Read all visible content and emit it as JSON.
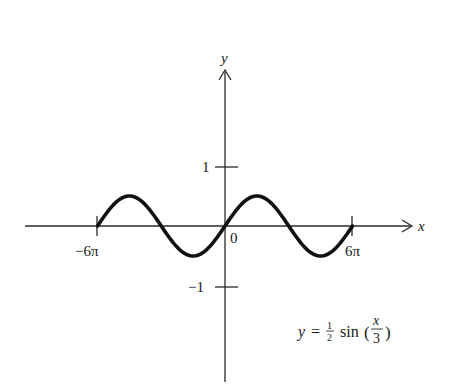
{
  "chart_data": {
    "type": "line",
    "title": "",
    "equation": "y = 1/2 sin(x/3)",
    "xlabel": "x",
    "ylabel": "y",
    "xlim": [
      -6.0,
      6.0
    ],
    "xlim_units": "pi",
    "ylim": [
      -1,
      1
    ],
    "grid": false,
    "legend": null,
    "x_ticks": [
      {
        "value": "-6π",
        "label": "−6π"
      },
      {
        "value": "0",
        "label": "0"
      },
      {
        "value": "6π",
        "label": "6π"
      }
    ],
    "y_ticks": [
      {
        "value": 1,
        "label": "1"
      },
      {
        "value": -1,
        "label": "−1"
      }
    ],
    "series": [
      {
        "name": "y = 1/2 sin(x/3)",
        "amplitude": 0.5,
        "period": "6π",
        "x": [
          "-6π",
          "-4.5π",
          "-3π",
          "-1.5π",
          "0",
          "1.5π",
          "3π",
          "4.5π",
          "6π"
        ],
        "values": [
          0,
          0.5,
          0,
          -0.5,
          0,
          0.5,
          0,
          -0.5,
          0
        ]
      }
    ],
    "annotations": [
      {
        "text": "y = ½ sin (x/3)",
        "position": "lower-right"
      }
    ]
  },
  "labels": {
    "y_axis": "y",
    "x_axis": "x",
    "origin": "0",
    "tick_pos1": "1",
    "tick_neg1": "−1",
    "tick_neg6pi": "−6π",
    "tick_6pi": "6π",
    "eq_y": "y",
    "eq_equals": "=",
    "eq_num": "1",
    "eq_den": "2",
    "eq_func": "sin",
    "eq_open": "(",
    "eq_frac_num": "x",
    "eq_frac_den": "3",
    "eq_close": ")"
  },
  "colors": {
    "curve": "#111111",
    "axes": "#2a2a2a",
    "background": "#ffffff"
  }
}
